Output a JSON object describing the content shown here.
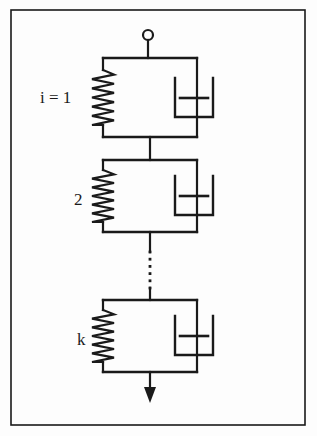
{
  "figure": {
    "background_color": "#fdfdfd",
    "line_color": "#1a1a1a",
    "border": {
      "name": "figure-frame",
      "x": 11,
      "y": 10,
      "width": 294,
      "height": 415,
      "stroke_width": 1.6
    },
    "top_terminal": {
      "label": "open-circle-node",
      "cx": 148,
      "cy": 35,
      "r": 5,
      "stem_from_y": 40,
      "stem_to_y": 58
    },
    "bottom_arrow": {
      "label": "load-arrow",
      "x": 150,
      "from_y": 372,
      "to_y": 403,
      "head_width": 12,
      "head_length": 16
    },
    "dotted_connector": {
      "label": "continuation-dots",
      "x": 150,
      "from_y": 252,
      "to_y": 288,
      "dot_count": 6
    },
    "elements": [
      {
        "id": "element-1",
        "label": "i = 1",
        "label_x": 40,
        "label_y": 103,
        "top_y": 58,
        "bottom_y": 137,
        "left_x": 103,
        "right_x": 197,
        "spring": {
          "name": "spring",
          "x": 103,
          "zigzag_peaks": 6,
          "amplitude": 11,
          "top_lead": 12,
          "bottom_lead": 12
        },
        "dashpot": {
          "name": "dashpot",
          "stem_x": 197,
          "cup_left": 175,
          "cup_right": 213,
          "cup_top": 78,
          "cup_bottom": 117,
          "piston_left": 180,
          "piston_right": 208,
          "piston_y": 98
        }
      },
      {
        "id": "element-2",
        "label": "2",
        "label_x": 74,
        "label_y": 205,
        "top_y": 160,
        "bottom_y": 232,
        "left_x": 103,
        "right_x": 197,
        "spring": {
          "name": "spring",
          "x": 103,
          "zigzag_peaks": 6,
          "amplitude": 11,
          "top_lead": 10,
          "bottom_lead": 10
        },
        "dashpot": {
          "name": "dashpot",
          "stem_x": 197,
          "cup_left": 175,
          "cup_right": 213,
          "cup_top": 176,
          "cup_bottom": 215,
          "piston_left": 180,
          "piston_right": 208,
          "piston_y": 196
        }
      },
      {
        "id": "element-k",
        "label": "k",
        "label_x": 77,
        "label_y": 345,
        "top_y": 300,
        "bottom_y": 372,
        "left_x": 103,
        "right_x": 197,
        "spring": {
          "name": "spring",
          "x": 103,
          "zigzag_peaks": 6,
          "amplitude": 11,
          "top_lead": 10,
          "bottom_lead": 10
        },
        "dashpot": {
          "name": "dashpot",
          "stem_x": 197,
          "cup_left": 175,
          "cup_right": 213,
          "cup_top": 316,
          "cup_bottom": 355,
          "piston_left": 180,
          "piston_right": 208,
          "piston_y": 336
        }
      }
    ],
    "series_links": [
      {
        "name": "link-1-to-2",
        "x": 150,
        "from_y": 137,
        "to_y": 160
      },
      {
        "name": "link-2-to-dots",
        "x": 150,
        "from_y": 232,
        "to_y": 252
      },
      {
        "name": "link-dots-to-k",
        "x": 150,
        "from_y": 288,
        "to_y": 300
      }
    ]
  }
}
